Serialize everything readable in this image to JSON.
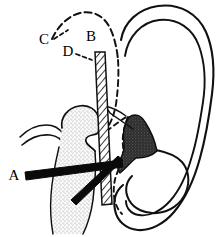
{
  "figure": {
    "background_color": "#ffffff",
    "ink_color": "#000000",
    "labels": [
      {
        "id": "label-a",
        "text": "A",
        "x": 14,
        "y": 180,
        "describes": "thick-black-bar-instrument",
        "leader": "none"
      },
      {
        "id": "label-b",
        "text": "B",
        "x": 91,
        "y": 41,
        "describes": "dashed-outline-upper",
        "leader": "none"
      },
      {
        "id": "label-c",
        "text": "C",
        "x": 44,
        "y": 44,
        "describes": "dashed-dome-arc",
        "leader": "dashed"
      },
      {
        "id": "label-d",
        "text": "D",
        "x": 68,
        "y": 56,
        "describes": "hatched-vertical-bar",
        "leader": "dashed"
      }
    ],
    "regions": [
      {
        "id": "ear-auricle",
        "name": "ear-outline",
        "fill": "none",
        "stroke": "#000000",
        "style": "double-line-outline"
      },
      {
        "id": "tragus-cartilage",
        "name": "dark-shaded-cartilage",
        "fill": "#3a3a3a",
        "stroke": "#000000",
        "style": "dark-stipple"
      },
      {
        "id": "mandibular-condyle",
        "name": "stippled-bone-region",
        "fill": "#dcdcdc",
        "stroke": "#000000",
        "style": "light-stipple"
      },
      {
        "id": "hatched-bar",
        "name": "hatched-vertical-bar",
        "fill": "#ffffff",
        "stroke": "#000000",
        "style": "diagonal-hatch"
      },
      {
        "id": "instrument-bar-a",
        "name": "thick-black-bar-horizontal",
        "fill": "#000000",
        "stroke": "#000000",
        "style": "solid-thick"
      },
      {
        "id": "instrument-bar-diagonal",
        "name": "thick-black-bar-diagonal",
        "fill": "#000000",
        "stroke": "#000000",
        "style": "solid-thick"
      },
      {
        "id": "dashed-dome",
        "name": "dashed-arc-outline",
        "fill": "none",
        "stroke": "#000000",
        "style": "dashed"
      },
      {
        "id": "zygomatic-arch",
        "name": "thin-curve-left",
        "fill": "none",
        "stroke": "#000000",
        "style": "thin-solid"
      }
    ]
  }
}
